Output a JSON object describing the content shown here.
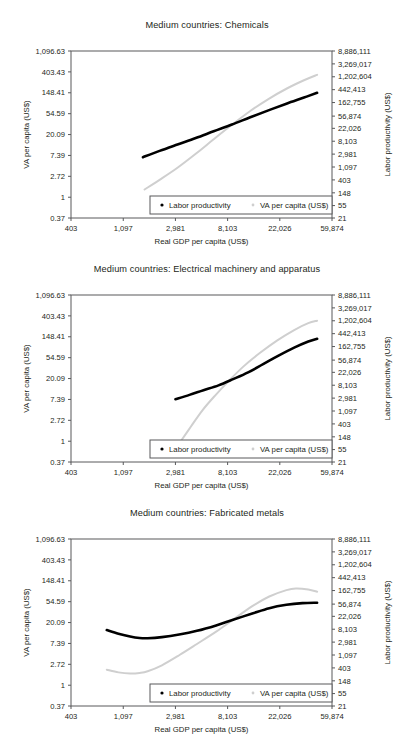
{
  "page": {
    "background": "#ffffff",
    "series_colors": {
      "labor_productivity": "#000000",
      "va_per_capita": "#cfcfcf"
    }
  },
  "axes": {
    "x": {
      "label": "Real GDP per capita (US$)",
      "ticks": [
        "403",
        "1,097",
        "2,981",
        "8,103",
        "22,026",
        "59,874"
      ],
      "tick_values": [
        403,
        1097,
        2981,
        8103,
        22026,
        59874
      ],
      "range": [
        403,
        59874
      ],
      "scale": "log"
    },
    "y_left": {
      "label": "VA per capita (US$)",
      "ticks": [
        "1,096.63",
        "403.43",
        "148.41",
        "54.59",
        "20.09",
        "7.39",
        "2.72",
        "1",
        "0.37"
      ],
      "tick_values": [
        1096.63,
        403.43,
        148.41,
        54.59,
        20.09,
        7.39,
        2.72,
        1,
        0.37
      ],
      "range": [
        0.37,
        1096.63
      ],
      "scale": "log"
    },
    "y_right": {
      "label": "Labor productivity (US$)",
      "ticks": [
        "8,886,111",
        "3,269,017",
        "1,202,604",
        "442,413",
        "162,755",
        "56,874",
        "22,026",
        "8,103",
        "2,981",
        "1,097",
        "403",
        "148",
        "55",
        "21"
      ],
      "tick_values": [
        8886111,
        3269017,
        1202604,
        442413,
        162755,
        56874,
        22026,
        8103,
        2981,
        1097,
        403,
        148,
        55,
        21
      ],
      "range": [
        21,
        8886111
      ],
      "scale": "log"
    }
  },
  "legend": {
    "items": [
      {
        "label": "Labor productivity",
        "marker": "dot-black",
        "color": "#000000"
      },
      {
        "label": "VA per capita (US$)",
        "marker": "dot-gray",
        "color": "#cfcfcf"
      }
    ]
  },
  "chart_data": [
    {
      "type": "line",
      "title": "Medium countries: Chemicals",
      "xlabel": "Real GDP per capita (US$)",
      "ylabel": "VA per capita (US$)",
      "ylabel_right": "Labor productivity (US$)",
      "xlim": [
        403,
        59874
      ],
      "ylim": [
        0.37,
        1096.63
      ],
      "xscale": "log",
      "yscale": "log",
      "grid": false,
      "legend_position": "bottom-right",
      "series": [
        {
          "name": "Labor productivity",
          "color": "#000000",
          "x": [
            1600,
            2200,
            3100,
            4400,
            6200,
            8800,
            12500,
            17700,
            25000,
            35000,
            45000
          ],
          "y": [
            6.8,
            9.2,
            12.5,
            17.0,
            23.5,
            32.5,
            46.0,
            64.0,
            88.0,
            118.0,
            148.0
          ]
        },
        {
          "name": "VA per capita (US$)",
          "color": "#cfcfcf",
          "x": [
            1650,
            2200,
            3100,
            4400,
            6200,
            8800,
            12500,
            17700,
            25000,
            35000,
            45000
          ],
          "y": [
            1.45,
            2.3,
            4.1,
            8.0,
            16.0,
            32.0,
            62.0,
            110.0,
            180.0,
            270.0,
            350.0
          ]
        }
      ]
    },
    {
      "type": "line",
      "title": "Medium countries: Electrical machinery and apparatus",
      "xlabel": "Real GDP per capita (US$)",
      "ylabel": "VA per capita (US$)",
      "ylabel_right": "Labor productivity (US$)",
      "xlim": [
        403,
        59874
      ],
      "ylim": [
        0.37,
        1096.63
      ],
      "xscale": "log",
      "yscale": "log",
      "grid": false,
      "legend_position": "bottom-right",
      "series": [
        {
          "name": "Labor productivity",
          "color": "#000000",
          "x": [
            2981,
            3900,
            5100,
            6800,
            9000,
            12000,
            16000,
            21500,
            29000,
            38000,
            45000
          ],
          "y": [
            7.5,
            9.2,
            11.5,
            14.5,
            19.5,
            27.0,
            40.0,
            60.0,
            88.0,
            118.0,
            135.0
          ]
        },
        {
          "name": "VA per capita (US$)",
          "color": "#cfcfcf",
          "x": [
            3300,
            4000,
            5000,
            6400,
            8300,
            11000,
            15000,
            21000,
            29000,
            38000,
            45000
          ],
          "y": [
            1.0,
            2.0,
            4.4,
            9.0,
            18.0,
            36.0,
            68.0,
            125.0,
            205.0,
            285.0,
            320.0
          ]
        }
      ]
    },
    {
      "type": "line",
      "title": "Medium countries: Fabricated metals",
      "xlabel": "Real GDP per capita (US$)",
      "ylabel": "VA per capita (US$)",
      "ylabel_right": "Labor productivity (US$)",
      "xlim": [
        403,
        59874
      ],
      "ylim": [
        0.37,
        1096.63
      ],
      "xscale": "log",
      "yscale": "log",
      "grid": false,
      "legend_position": "bottom-right",
      "series": [
        {
          "name": "Labor productivity",
          "color": "#000000",
          "x": [
            800,
            1000,
            1250,
            1500,
            1750,
            2300,
            3200,
            4500,
            6500,
            9000,
            13000,
            18000,
            25000,
            34000,
            45000
          ],
          "y": [
            14.0,
            11.8,
            10.3,
            9.6,
            9.5,
            10.0,
            11.3,
            13.5,
            17.5,
            23.0,
            31.0,
            40.0,
            47.0,
            51.0,
            52.0
          ]
        },
        {
          "name": "VA per capita (US$)",
          "color": "#cfcfcf",
          "x": [
            800,
            1000,
            1250,
            1500,
            1750,
            2300,
            3200,
            4500,
            6500,
            9000,
            13000,
            18000,
            25000,
            30000,
            38000,
            45000
          ],
          "y": [
            2.1,
            1.85,
            1.75,
            1.8,
            1.95,
            2.6,
            4.2,
            7.2,
            13.0,
            23.0,
            44.0,
            70.0,
            95.0,
            103.0,
            98.0,
            88.0
          ]
        }
      ]
    }
  ]
}
